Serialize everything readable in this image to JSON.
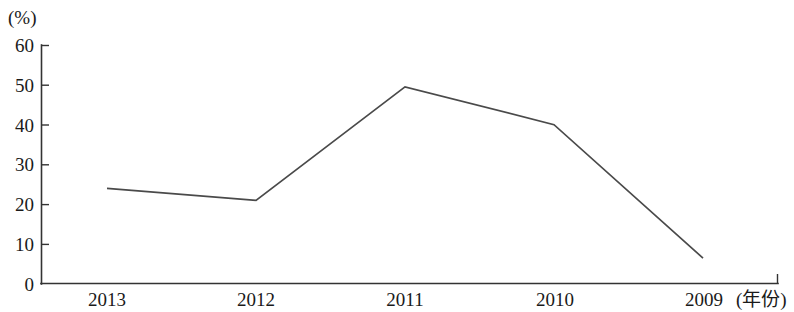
{
  "chart_data": {
    "type": "line",
    "title": "",
    "xlabel": "(年份)",
    "ylabel": "(%)",
    "categories": [
      "2013",
      "2012",
      "2011",
      "2010",
      "2009"
    ],
    "values": [
      24,
      21,
      49.5,
      40,
      6.5
    ],
    "series": [
      {
        "name": "",
        "values": [
          24,
          21,
          49.5,
          40,
          6.5
        ]
      }
    ],
    "ylim": [
      0,
      60
    ],
    "yticks": [
      "0",
      "10",
      "20",
      "30",
      "40",
      "50",
      "60"
    ],
    "ytick_values": [
      0,
      10,
      20,
      30,
      40,
      50,
      60
    ],
    "grid": false,
    "legend": false,
    "legend_position": "none",
    "markers": false,
    "line_color": "#4a4a4a",
    "axis_color": "#333333",
    "background_color": "#ffffff"
  },
  "axes": {
    "y_unit_label": "(%)",
    "x_unit_label": "(年份)"
  }
}
